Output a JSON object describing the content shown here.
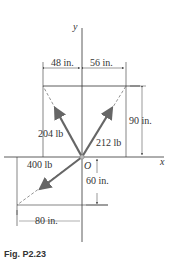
{
  "figure": {
    "caption": "Fig. P2.23",
    "axes": {
      "x_label": "x",
      "y_label": "y",
      "origin_label": "O"
    },
    "dimensions": {
      "left_width": "48 in.",
      "right_width": "56 in.",
      "top_height": "90 in.",
      "bottom_height": "60 in.",
      "bottom_width": "80 in."
    },
    "forces": [
      {
        "name": "F1",
        "label": "204 lb",
        "direction": "up-left",
        "to": [
          -48,
          90
        ]
      },
      {
        "name": "F2",
        "label": "212 lb",
        "direction": "up-right",
        "to": [
          56,
          90
        ]
      },
      {
        "name": "F3",
        "label": "400 lb",
        "direction": "down-left",
        "to": [
          -80,
          -60
        ]
      }
    ],
    "colors": {
      "line": "#333333",
      "arrow": "#666666",
      "text": "#333333"
    }
  }
}
